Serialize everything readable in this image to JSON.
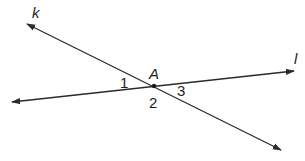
{
  "diagram": {
    "type": "intersecting-lines",
    "colors": {
      "line": "#2a2a2a",
      "text": "#1e1e1e",
      "background": "#ffffff"
    },
    "lines": [
      {
        "name": "k",
        "from": [
          27,
          24
        ],
        "to": [
          281,
          150
        ],
        "arrows": "both"
      },
      {
        "name": "l",
        "from": [
          12,
          102
        ],
        "to": [
          294,
          71
        ],
        "arrows": "both"
      }
    ],
    "intersection": {
      "name": "A",
      "x": 154,
      "y": 86
    },
    "labels": {
      "line_k": "k",
      "line_l": "l",
      "point_a": "A",
      "angle_1": "1",
      "angle_2": "2",
      "angle_3": "3"
    }
  }
}
